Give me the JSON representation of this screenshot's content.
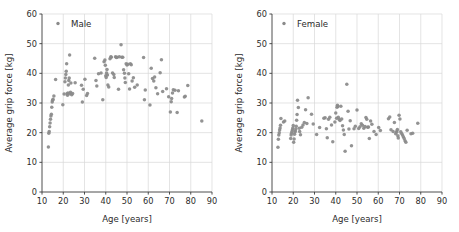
{
  "figure": {
    "panel_count": 2,
    "marker_color": "#8a8a8a",
    "grid_color": "#d8d8d8",
    "axis_color": "#3b3b3b",
    "background": "#ffffff"
  },
  "chart_data": [
    {
      "type": "scatter",
      "title": "",
      "legend": "Male",
      "legend_position": "upper-left",
      "xlabel": "Age [years]",
      "ylabel": "Average grip force [kg]",
      "xlim": [
        10,
        90
      ],
      "ylim": [
        0,
        60
      ],
      "xticks": [
        10,
        20,
        30,
        40,
        50,
        60,
        70,
        80,
        90
      ],
      "yticks": [
        0,
        10,
        20,
        30,
        40,
        50,
        60
      ],
      "grid": true,
      "marker_color": "#8a8a8a",
      "points": [
        [
          13.0,
          15.2
        ],
        [
          13.2,
          19.8
        ],
        [
          13.4,
          20.4
        ],
        [
          13.6,
          22.0
        ],
        [
          13.8,
          23.3
        ],
        [
          14.0,
          24.5
        ],
        [
          14.2,
          25.6
        ],
        [
          14.4,
          26.2
        ],
        [
          14.6,
          28.6
        ],
        [
          14.8,
          30.3
        ],
        [
          15.0,
          30.9
        ],
        [
          15.2,
          31.3
        ],
        [
          15.6,
          32.4
        ],
        [
          16.4,
          37.9
        ],
        [
          19.8,
          29.4
        ],
        [
          20.4,
          33.0
        ],
        [
          20.8,
          37.2
        ],
        [
          21.0,
          38.4
        ],
        [
          21.2,
          39.6
        ],
        [
          21.4,
          40.7
        ],
        [
          21.6,
          43.2
        ],
        [
          21.8,
          33.1
        ],
        [
          22.0,
          32.6
        ],
        [
          22.2,
          33.4
        ],
        [
          22.4,
          36.1
        ],
        [
          22.6,
          37.6
        ],
        [
          22.8,
          38.4
        ],
        [
          23.0,
          46.2
        ],
        [
          23.2,
          33.1
        ],
        [
          23.4,
          33.6
        ],
        [
          23.6,
          36.7
        ],
        [
          24.0,
          32.8
        ],
        [
          24.4,
          33.2
        ],
        [
          25.6,
          36.8
        ],
        [
          28.6,
          36.0
        ],
        [
          29.0,
          30.3
        ],
        [
          29.4,
          34.6
        ],
        [
          30.2,
          38.0
        ],
        [
          31.0,
          32.5
        ],
        [
          31.4,
          33.2
        ],
        [
          34.8,
          45.1
        ],
        [
          35.4,
          37.6
        ],
        [
          35.8,
          35.7
        ],
        [
          36.6,
          39.9
        ],
        [
          37.8,
          40.1
        ],
        [
          38.6,
          31.1
        ],
        [
          39.2,
          43.9
        ],
        [
          39.6,
          44.5
        ],
        [
          39.8,
          42.7
        ],
        [
          40.0,
          39.2
        ],
        [
          40.2,
          38.6
        ],
        [
          40.4,
          40.1
        ],
        [
          40.6,
          41.3
        ],
        [
          40.8,
          39.4
        ],
        [
          41.0,
          36.1
        ],
        [
          41.4,
          35.4
        ],
        [
          42.0,
          44.9
        ],
        [
          42.4,
          45.6
        ],
        [
          42.6,
          45.4
        ],
        [
          43.2,
          40.1
        ],
        [
          43.8,
          39.6
        ],
        [
          44.0,
          38.6
        ],
        [
          44.6,
          45.6
        ],
        [
          45.0,
          45.3
        ],
        [
          45.4,
          45.4
        ],
        [
          46.0,
          34.6
        ],
        [
          46.4,
          45.6
        ],
        [
          47.2,
          49.6
        ],
        [
          47.6,
          45.4
        ],
        [
          48.0,
          45.4
        ],
        [
          48.4,
          41.2
        ],
        [
          48.8,
          40.0
        ],
        [
          49.0,
          38.4
        ],
        [
          49.2,
          36.9
        ],
        [
          49.6,
          43.2
        ],
        [
          50.0,
          42.8
        ],
        [
          50.4,
          43.1
        ],
        [
          50.8,
          39.9
        ],
        [
          51.2,
          34.7
        ],
        [
          51.6,
          43.2
        ],
        [
          52.0,
          42.9
        ],
        [
          52.4,
          37.4
        ],
        [
          53.0,
          38.5
        ],
        [
          53.6,
          35.3
        ],
        [
          54.8,
          36.1
        ],
        [
          57.8,
          45.3
        ],
        [
          58.2,
          31.1
        ],
        [
          58.6,
          34.4
        ],
        [
          60.8,
          29.3
        ],
        [
          61.4,
          41.7
        ],
        [
          62.0,
          38.3
        ],
        [
          62.6,
          37.4
        ],
        [
          63.0,
          38.8
        ],
        [
          63.6,
          35.1
        ],
        [
          64.4,
          33.1
        ],
        [
          65.6,
          40.2
        ],
        [
          66.2,
          44.6
        ],
        [
          66.8,
          33.9
        ],
        [
          68.6,
          34.8
        ],
        [
          69.6,
          32.1
        ],
        [
          70.4,
          27.0
        ],
        [
          70.8,
          30.4
        ],
        [
          71.0,
          31.5
        ],
        [
          71.4,
          33.4
        ],
        [
          71.8,
          34.5
        ],
        [
          72.6,
          34.3
        ],
        [
          73.6,
          26.8
        ],
        [
          74.2,
          34.1
        ],
        [
          77.0,
          32.0
        ],
        [
          77.4,
          32.3
        ],
        [
          78.6,
          35.9
        ],
        [
          85.2,
          23.9
        ]
      ]
    },
    {
      "type": "scatter",
      "title": "",
      "legend": "Female",
      "legend_position": "upper-left",
      "xlabel": "Age [years]",
      "ylabel": "Average grip force [kg]",
      "xlim": [
        10,
        90
      ],
      "ylim": [
        0,
        60
      ],
      "xticks": [
        10,
        20,
        30,
        40,
        50,
        60,
        70,
        80,
        90
      ],
      "yticks": [
        0,
        10,
        20,
        30,
        40,
        50,
        60
      ],
      "grid": true,
      "marker_color": "#8a8a8a",
      "points": [
        [
          12.8,
          15.1
        ],
        [
          13.0,
          17.8
        ],
        [
          13.2,
          19.2
        ],
        [
          13.4,
          20.0
        ],
        [
          13.6,
          20.9
        ],
        [
          13.8,
          21.6
        ],
        [
          14.0,
          22.5
        ],
        [
          14.2,
          24.8
        ],
        [
          15.4,
          23.6
        ],
        [
          16.0,
          23.9
        ],
        [
          18.8,
          18.0
        ],
        [
          19.0,
          19.2
        ],
        [
          19.2,
          19.8
        ],
        [
          19.4,
          20.4
        ],
        [
          19.6,
          21.0
        ],
        [
          19.8,
          21.6
        ],
        [
          20.0,
          22.4
        ],
        [
          20.2,
          16.8
        ],
        [
          20.4,
          17.9
        ],
        [
          20.6,
          19.5
        ],
        [
          20.8,
          20.2
        ],
        [
          21.0,
          20.6
        ],
        [
          21.2,
          21.2
        ],
        [
          21.4,
          22.2
        ],
        [
          21.6,
          24.2
        ],
        [
          21.8,
          26.1
        ],
        [
          22.0,
          30.9
        ],
        [
          22.4,
          28.5
        ],
        [
          22.8,
          21.5
        ],
        [
          23.0,
          20.4
        ],
        [
          23.4,
          19.3
        ],
        [
          24.0,
          21.8
        ],
        [
          24.6,
          22.6
        ],
        [
          25.2,
          23.4
        ],
        [
          25.8,
          27.7
        ],
        [
          26.4,
          23.1
        ],
        [
          27.0,
          31.8
        ],
        [
          28.6,
          26.2
        ],
        [
          29.4,
          22.9
        ],
        [
          31.0,
          19.4
        ],
        [
          32.4,
          21.7
        ],
        [
          34.4,
          24.9
        ],
        [
          35.0,
          25.0
        ],
        [
          35.6,
          21.3
        ],
        [
          36.0,
          18.3
        ],
        [
          36.6,
          24.5
        ],
        [
          37.2,
          25.2
        ],
        [
          38.0,
          22.6
        ],
        [
          38.6,
          16.9
        ],
        [
          39.6,
          23.6
        ],
        [
          40.0,
          26.6
        ],
        [
          40.4,
          24.9
        ],
        [
          40.6,
          28.6
        ],
        [
          40.8,
          29.2
        ],
        [
          41.0,
          28.8
        ],
        [
          41.2,
          25.2
        ],
        [
          41.6,
          24.4
        ],
        [
          42.0,
          24.1
        ],
        [
          42.4,
          28.9
        ],
        [
          42.8,
          24.6
        ],
        [
          43.2,
          22.3
        ],
        [
          43.6,
          20.9
        ],
        [
          44.0,
          19.4
        ],
        [
          44.4,
          13.7
        ],
        [
          45.2,
          36.3
        ],
        [
          45.8,
          27.2
        ],
        [
          46.2,
          21.2
        ],
        [
          46.8,
          24.0
        ],
        [
          47.4,
          15.6
        ],
        [
          48.6,
          21.3
        ],
        [
          49.2,
          22.2
        ],
        [
          50.0,
          27.6
        ],
        [
          50.8,
          21.4
        ],
        [
          51.4,
          22.0
        ],
        [
          52.0,
          23.0
        ],
        [
          52.6,
          22.5
        ],
        [
          53.2,
          21.5
        ],
        [
          53.8,
          22.1
        ],
        [
          54.2,
          25.1
        ],
        [
          54.6,
          24.5
        ],
        [
          55.0,
          21.8
        ],
        [
          55.4,
          21.9
        ],
        [
          55.8,
          18.0
        ],
        [
          56.4,
          23.9
        ],
        [
          57.0,
          22.8
        ],
        [
          58.0,
          20.4
        ],
        [
          59.0,
          19.4
        ],
        [
          60.2,
          21.7
        ],
        [
          61.0,
          20.7
        ],
        [
          64.8,
          24.7
        ],
        [
          65.4,
          25.3
        ],
        [
          66.0,
          21.0
        ],
        [
          67.0,
          20.4
        ],
        [
          67.6,
          23.4
        ],
        [
          68.2,
          19.6
        ],
        [
          68.6,
          20.1
        ],
        [
          68.8,
          20.6
        ],
        [
          69.0,
          21.1
        ],
        [
          69.2,
          19.0
        ],
        [
          69.4,
          18.2
        ],
        [
          69.8,
          25.9
        ],
        [
          70.2,
          24.6
        ],
        [
          70.6,
          20.3
        ],
        [
          71.0,
          19.7
        ],
        [
          71.4,
          19.2
        ],
        [
          71.8,
          18.6
        ],
        [
          72.2,
          18.0
        ],
        [
          72.6,
          17.3
        ],
        [
          73.0,
          16.8
        ],
        [
          73.6,
          20.8
        ],
        [
          75.4,
          19.6
        ],
        [
          76.2,
          19.8
        ],
        [
          78.6,
          23.2
        ]
      ]
    }
  ]
}
